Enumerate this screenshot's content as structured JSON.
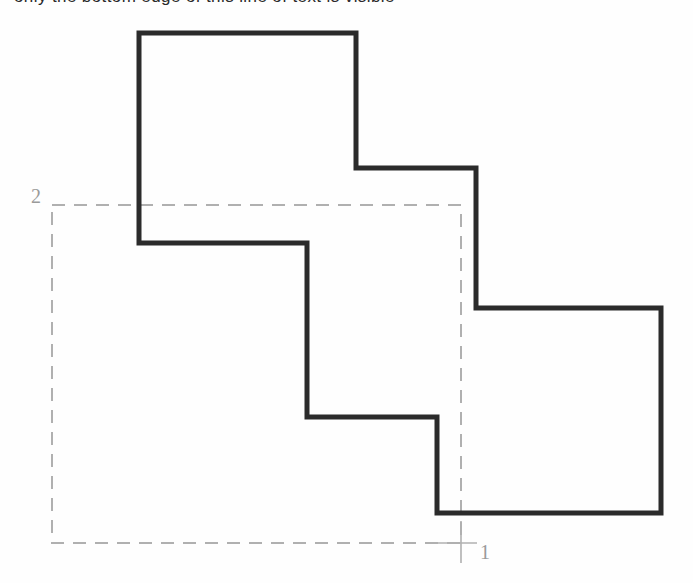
{
  "page": {
    "width": 693,
    "height": 583,
    "background_color": "#fefefe",
    "caption_clipped_text": "only the bottom edge of this line of text is visible"
  },
  "figure": {
    "stroke_color": "#2b2b2b",
    "stroke_width": 5,
    "dashed_color": "#b0b0b0",
    "dashed_width": 1.6,
    "dash_pattern": "13 9",
    "solid_polygon_points": "139,33 356,33 356,168 476,168 476,308 661,308 661,513 437,513 437,417 307,417 307,243 139,243",
    "dashed_rect": {
      "x": 52,
      "y": 205,
      "width": 409,
      "height": 338
    },
    "crosshair": {
      "x": 461,
      "y": 543,
      "arm_left": 28,
      "arm_right": 16,
      "arm_up": 22,
      "arm_down": 20
    }
  },
  "labels": {
    "axis_1": "1",
    "axis_2": "2"
  }
}
